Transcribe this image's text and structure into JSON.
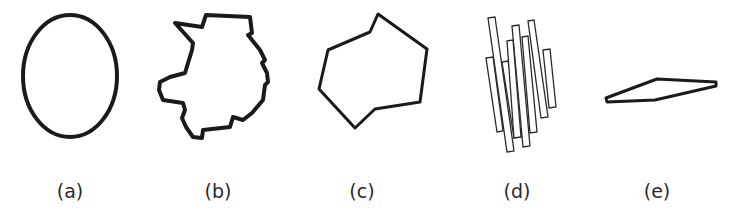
{
  "figure": {
    "panels": [
      {
        "id": "a",
        "label": "(a)",
        "shape": "ellipse",
        "label_x": 70
      },
      {
        "id": "b",
        "label": "(b)",
        "shape": "irregular-blob",
        "label_x": 218
      },
      {
        "id": "c",
        "label": "(c)",
        "shape": "irregular-polygon",
        "label_x": 362
      },
      {
        "id": "d",
        "label": "(d)",
        "shape": "stacked-slanted-rectangles",
        "label_x": 517
      },
      {
        "id": "e",
        "label": "(e)",
        "shape": "thin-parallelogram",
        "label_x": 657
      }
    ]
  }
}
